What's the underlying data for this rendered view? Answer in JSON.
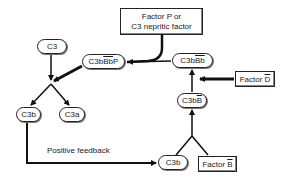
{
  "diagram": {
    "nodes": {
      "factor_p": {
        "line1": "Factor P or",
        "line2": "C3 nepritic factor"
      },
      "c3": {
        "label": "C3"
      },
      "c3bbbp": {
        "prefix": "C3b",
        "overline": "Bb",
        "suffix": "P"
      },
      "c3bbb": {
        "prefix": "C3b",
        "overline": "Bb"
      },
      "factor_d": {
        "prefix": "Factor ",
        "overline": "D"
      },
      "c3bb": {
        "prefix": "C3b",
        "overline": "B"
      },
      "c3b_left": {
        "label": "C3b"
      },
      "c3a": {
        "label": "C3a"
      },
      "c3b_bottom": {
        "label": "C3b"
      },
      "factor_b": {
        "prefix": "Factor ",
        "overline": "B"
      }
    },
    "labels": {
      "positive_feedback": "Positive feedback"
    },
    "edges": [
      {
        "from": "factor_p",
        "to": "c3bbbp"
      },
      {
        "from": "c3",
        "to": "split_c3"
      },
      {
        "from": "c3bbbp",
        "to": "split_c3"
      },
      {
        "from": "split_c3",
        "to": "c3b_left"
      },
      {
        "from": "split_c3",
        "to": "c3a"
      },
      {
        "from": "c3b_left",
        "to": "c3b_bottom",
        "label": "Positive feedback"
      },
      {
        "from": "c3b_bottom",
        "to": "c3bb"
      },
      {
        "from": "factor_b",
        "to": "c3bb"
      },
      {
        "from": "c3bb",
        "to": "c3bbb"
      },
      {
        "from": "factor_d",
        "to": "c3bb_to_c3bbb_edge"
      },
      {
        "from": "c3bbb",
        "to": "c3bbbp"
      }
    ]
  }
}
